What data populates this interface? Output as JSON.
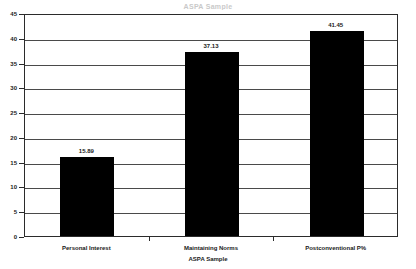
{
  "title_sliver": "ASPA Sample",
  "chart_data": {
    "type": "bar",
    "title": "",
    "xlabel": "ASPA Sample",
    "ylabel": "",
    "categories": [
      "Personal Interest",
      "Maintaining Norms",
      "Postconventional P%"
    ],
    "values": [
      15.89,
      37.13,
      41.45
    ],
    "value_labels": [
      "15.89",
      "37.13",
      "41.45"
    ],
    "ylim": [
      0,
      45
    ],
    "yticks": [
      0,
      5,
      10,
      15,
      20,
      25,
      30,
      35,
      40,
      45
    ],
    "ytick_labels": [
      "0",
      "5",
      "10",
      "15",
      "20",
      "25",
      "30",
      "35",
      "40",
      "45"
    ],
    "grid": true,
    "legend": false,
    "bar_color": "#000000",
    "axis_color": "#2b2b2b",
    "grid_color": "#4a4a4a"
  }
}
